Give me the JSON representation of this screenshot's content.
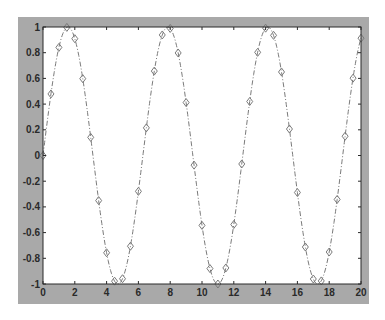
{
  "chart_data": {
    "type": "line",
    "title": "",
    "xlabel": "",
    "ylabel": "",
    "xlim": [
      0,
      20
    ],
    "ylim": [
      -1,
      1
    ],
    "grid": false,
    "legend": null,
    "x_ticks": [
      "0",
      "2",
      "4",
      "6",
      "8",
      "10",
      "12",
      "14",
      "16",
      "18",
      "20"
    ],
    "y_ticks": [
      "1",
      "0.8",
      "0.6",
      "0.4",
      "0.2",
      "0",
      "-0.2",
      "-0.4",
      "-0.6",
      "-0.8",
      "-1"
    ],
    "series": [
      {
        "name": "sin(x)",
        "line_style": "dash-dot",
        "marker": "diamond",
        "color": "#7a7a7a",
        "x": [
          0,
          0.5,
          1,
          1.5,
          2,
          2.5,
          3,
          3.5,
          4,
          4.5,
          5,
          5.5,
          6,
          6.5,
          7,
          7.5,
          8,
          8.5,
          9,
          9.5,
          10,
          10.5,
          11,
          11.5,
          12,
          12.5,
          13,
          13.5,
          14,
          14.5,
          15,
          15.5,
          16,
          16.5,
          17,
          17.5,
          18,
          18.5,
          19,
          19.5,
          20
        ],
        "y": [
          0,
          0.479,
          0.841,
          0.997,
          0.909,
          0.598,
          0.141,
          -0.351,
          -0.757,
          -0.978,
          -0.959,
          -0.706,
          -0.279,
          0.215,
          0.657,
          0.938,
          0.989,
          0.798,
          0.412,
          -0.075,
          -0.544,
          -0.88,
          -1.0,
          -0.875,
          -0.537,
          -0.066,
          0.42,
          0.803,
          0.991,
          0.935,
          0.65,
          0.206,
          -0.288,
          -0.712,
          -0.961,
          -0.976,
          -0.751,
          -0.342,
          0.15,
          0.602,
          0.913
        ]
      }
    ]
  },
  "colors": {
    "figure_background": "#a9a9a9",
    "axes_background": "#ffffff",
    "axis_color": "#2a2a2a",
    "series_color": "#7a7a7a"
  }
}
